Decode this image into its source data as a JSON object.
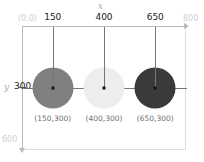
{
  "diagram": {
    "axes": {
      "x_name": "x",
      "y_name": "y",
      "origin_label": "(0,0)",
      "x_max_label": "800",
      "y_max_label": "600",
      "x_ticks": [
        "150",
        "400",
        "650"
      ],
      "y_ticks": [
        "300"
      ]
    },
    "colors": {
      "frame": "#dcdcdc",
      "axis": "#b9b9b9",
      "guide": "#767676",
      "tick_text": "#1a1a1a",
      "muted_text": "#cfcfcf",
      "caption_text": "#6e6e6e",
      "center_dot": "#141414"
    },
    "circles": [
      {
        "id": "circle-1",
        "cx": 150,
        "cy": 300,
        "radius": 100,
        "fill": "#808080",
        "caption": "(150,300)",
        "tick": "150"
      },
      {
        "id": "circle-2",
        "cx": 400,
        "cy": 300,
        "radius": 100,
        "fill": "#ededed",
        "caption": "(400,300)",
        "tick": "400"
      },
      {
        "id": "circle-3",
        "cx": 650,
        "cy": 300,
        "radius": 100,
        "fill": "#3a3a3a",
        "caption": "(650,300)",
        "tick": "650"
      }
    ]
  },
  "chart_data": {
    "type": "scatter",
    "xlabel": "x",
    "ylabel": "y",
    "xlim": [
      0,
      800
    ],
    "ylim": [
      600,
      0
    ],
    "grid": false,
    "legend": null,
    "xticks": [
      150,
      400,
      650
    ],
    "yticks": [
      300
    ],
    "x": [
      150,
      400,
      650
    ],
    "y": [
      300,
      300,
      300
    ],
    "marker_radius": [
      100,
      100,
      100
    ],
    "marker_colors": [
      "#808080",
      "#ededed",
      "#3a3a3a"
    ],
    "point_labels": [
      "(150,300)",
      "(400,300)",
      "(650,300)"
    ],
    "annotations": [
      "(0,0)",
      "800",
      "600"
    ]
  }
}
